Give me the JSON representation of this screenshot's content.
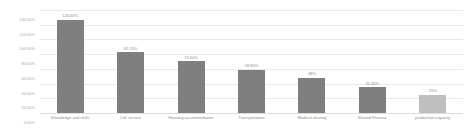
{
  "chart_data": {
    "type": "bar",
    "title": "",
    "xlabel": "",
    "ylabel": "",
    "ylim": [
      0,
      140
    ],
    "grid": true,
    "legend": false,
    "categories": [
      "Knowledge and skills",
      "Life service",
      "Housing accommodation",
      "Transportation",
      "Medical sharing",
      "Shared Finance",
      "production capacity"
    ],
    "values": [
      126.6,
      82.7,
      70.6,
      58.8,
      48,
      35.3,
      25
    ],
    "value_labels": [
      "126.60%",
      "82.70%",
      "70.60%",
      "58.80%",
      "48%",
      "35.30%",
      "25%"
    ],
    "ytick_labels": [
      "140.00%",
      "120.00%",
      "100.00%",
      "80.00%",
      "60.00%",
      "40.00%",
      "20.00%",
      "0.00%"
    ],
    "ytick_values": [
      140,
      120,
      100,
      80,
      60,
      40,
      20,
      0
    ],
    "bar_colors": [
      "#7f7f7f",
      "#7f7f7f",
      "#7f7f7f",
      "#7f7f7f",
      "#7f7f7f",
      "#7f7f7f",
      "#bfbfbf"
    ],
    "gridline_color": "#e8e8e8",
    "axis_text_color": "#a6a6a6",
    "label_text_color": "#8c8c8c",
    "background": "#ffffff"
  }
}
